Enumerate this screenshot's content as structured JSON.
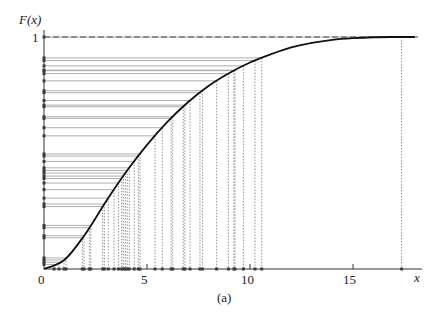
{
  "chart_data": {
    "type": "line",
    "title": "",
    "caption": "(a)",
    "xlabel": "x",
    "ylabel": "F(x)",
    "xlim": [
      0,
      18.5
    ],
    "ylim": [
      0,
      1
    ],
    "x_ticks": [
      0,
      5,
      10,
      15
    ],
    "x_tick_labels": [
      "0",
      "5",
      "10",
      "15"
    ],
    "y_ticks": [
      1
    ],
    "y_tick_labels": [
      "1"
    ],
    "grid": false,
    "legend": null,
    "asymptote": {
      "y": 1,
      "style": "dashed"
    },
    "series": [
      {
        "name": "F(x) CDF",
        "style": "solid",
        "x": [
          0,
          1,
          2,
          3,
          4,
          5,
          6,
          7,
          8,
          9,
          10,
          11,
          12,
          13,
          14,
          15,
          16,
          17,
          18
        ],
        "values": [
          0,
          0.04,
          0.15,
          0.29,
          0.42,
          0.535,
          0.635,
          0.72,
          0.79,
          0.845,
          0.89,
          0.925,
          0.955,
          0.975,
          0.988,
          0.995,
          0.999,
          1.0,
          1.0
        ]
      }
    ],
    "samples": {
      "description": "Inverse-transform samples: horizontal lines from F axis to curve, dotted verticals down to x axis",
      "x": [
        0.49,
        0.73,
        0.97,
        1.07,
        1.86,
        1.94,
        2.2,
        2.27,
        2.85,
        2.93,
        3.12,
        3.4,
        3.62,
        3.77,
        3.85,
        3.95,
        4.04,
        4.14,
        4.38,
        4.58,
        4.66,
        5.39,
        5.74,
        6.17,
        6.25,
        6.76,
        6.84,
        7.09,
        7.57,
        7.69,
        8.38,
        8.95,
        9.22,
        9.27,
        9.68,
        10.24,
        10.57,
        17.36
      ]
    }
  },
  "labels": {
    "y_axis": "F(x)",
    "x_axis": "x",
    "y_one": "1",
    "x0": "0",
    "x5": "5",
    "x10": "10",
    "x15": "15",
    "caption": "(a)"
  }
}
